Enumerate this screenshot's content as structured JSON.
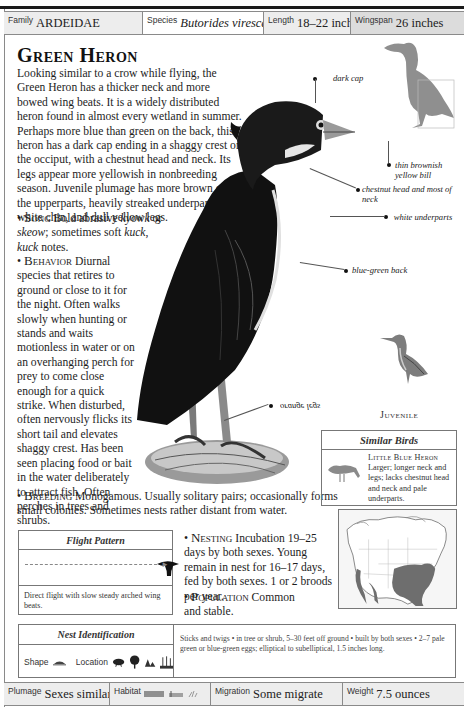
{
  "page": {
    "running_header": "BIRDS OF NORTH AMERICA"
  },
  "info_top": {
    "family": {
      "label": "Family",
      "value": "ARDEIDAE"
    },
    "species": {
      "label": "Species",
      "value": "Butorides virescens"
    },
    "length": {
      "label": "Length",
      "value": "18–22 inches"
    },
    "wingspan": {
      "label": "Wingspan",
      "value": "26 inches"
    }
  },
  "title": "Green Heron",
  "description": {
    "intro": "Looking similar to a crow while flying, the Green Heron has a thicker neck and more bowed wing beats. It is a widely distributed heron found in almost every wetland in summer. Perhaps more blue than green on the back, this heron has a dark cap ending in a shaggy crest on the occiput, with a chestnut head and neck. Its legs appear more yellowish in nonbreeding season. Juvenile plumage has more brown on the upperparts, heavily streaked underparts, a white chin, and dull yellow legs.",
    "song": {
      "label": "Song",
      "text_pre": "Bold abrasive ",
      "call1": "kyowk",
      "text_mid": " or ",
      "call2": "skeow",
      "text_mid2": "; sometimes soft ",
      "call3": "kuck",
      "text_mid3": ", ",
      "call4": "kuck",
      "text_post": " notes."
    },
    "behavior": {
      "label": "Behavior",
      "text": "Diurnal species that retires to ground or close to it for the night. Often walks slowly when hunting or stands and waits motionless in water or on an overhanging perch for prey to come close enough for a quick strike. When disturbed, often nervously flicks its short tail and elevates shaggy crest. Has been seen placing food or bait in the water deliberately to attract fish. Often perches in trees and shrubs."
    },
    "breeding": {
      "label": "Breeding",
      "text": "Monogamous. Usually solitary pairs; occasionally forms small colonies. Sometimes nests rather distant from water."
    },
    "nesting": {
      "label": "Nesting",
      "text": "Incubation 19–25 days by both sexes. Young remain in nest for 16–17 days, fed by both sexes. 1 or 2 broods per year."
    },
    "population": {
      "label": "Population",
      "text": "Common and stable."
    }
  },
  "annotations": {
    "dark_cap": "dark cap",
    "bill": "thin brownish yellow bill",
    "chestnut": "chestnut head and most of neck",
    "underparts": "white underparts",
    "back": "blue-green back",
    "legs": "orange legs"
  },
  "juvenile_label": "Juvenile",
  "similar_birds": {
    "heading": "Similar Birds",
    "items": [
      {
        "name": "Little Blue Heron",
        "text": "Larger; longer neck and legs; lacks chestnut head and neck and pale underparts."
      }
    ]
  },
  "flight_pattern": {
    "heading": "Flight Pattern",
    "caption": "Direct flight with slow steady arched wing beats."
  },
  "nest_identification": {
    "heading": "Nest Identification",
    "shape_label": "Shape",
    "location_label": "Location",
    "location_icons": [
      "shrub-icon",
      "tree-icon",
      "ground-rocks-icon",
      "marsh-reeds-icon"
    ],
    "details": "Sticks and twigs • in tree or shrub, 5–30 feet off ground • built by both sexes • 2–7 pale green or blue-green eggs; elliptical to subelliptical, 1.5 inches long."
  },
  "info_bottom": {
    "plumage": {
      "label": "Plumage",
      "value": "Sexes similar"
    },
    "habitat": {
      "label": "Habitat",
      "icons": [
        "water-icon",
        "marsh-icon",
        "shrub-wetland-icon"
      ]
    },
    "migration": {
      "label": "Migration",
      "value": "Some migrate"
    },
    "weight": {
      "label": "Weight",
      "value": "7.5 ounces"
    }
  },
  "colors": {
    "rule": "#1a1a1a",
    "bar_bg": "#ededed",
    "silhouette": "#8f8f8f",
    "map_range": "#6e6e6e"
  }
}
